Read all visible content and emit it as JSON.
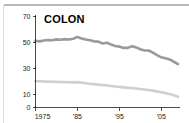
{
  "chart_data": {
    "type": "line",
    "title": "COLON",
    "xlabel": "",
    "ylabel": "",
    "xlim": [
      1975,
      2009
    ],
    "ylim": [
      0,
      70
    ],
    "grid": false,
    "legend": "none",
    "y_ticks": [
      0,
      10,
      30,
      50,
      70
    ],
    "y_tick_labels": [
      "0",
      "10",
      "30",
      "50",
      "70"
    ],
    "x_ticks": [
      1975,
      1985,
      1995,
      2005
    ],
    "x_tick_labels": [
      "1975",
      "'85",
      "'95",
      "'05"
    ],
    "series": [
      {
        "name": "incidence-dark",
        "color": "#9a9a9a",
        "stroke_width": 2.6,
        "x": [
          1975,
          1976,
          1977,
          1978,
          1979,
          1980,
          1981,
          1982,
          1983,
          1984,
          1985,
          1986,
          1987,
          1988,
          1989,
          1990,
          1991,
          1992,
          1993,
          1994,
          1995,
          1996,
          1997,
          1998,
          1999,
          2000,
          2001,
          2002,
          2003,
          2004,
          2005,
          2006,
          2007,
          2008,
          2009
        ],
        "values": [
          51.0,
          50.6,
          51.2,
          51.6,
          51.5,
          52.1,
          51.8,
          52.3,
          52.0,
          52.6,
          54.0,
          52.8,
          52.0,
          51.5,
          50.6,
          50.4,
          49.0,
          49.6,
          48.2,
          47.0,
          46.6,
          45.6,
          45.6,
          46.8,
          46.0,
          44.6,
          43.6,
          43.6,
          42.0,
          40.0,
          38.4,
          37.6,
          36.8,
          35.0,
          33.2
        ]
      },
      {
        "name": "mortality-light",
        "color": "#cfcfcf",
        "stroke_width": 2.6,
        "x": [
          1975,
          1976,
          1977,
          1978,
          1979,
          1980,
          1981,
          1982,
          1983,
          1984,
          1985,
          1986,
          1987,
          1988,
          1989,
          1990,
          1991,
          1992,
          1993,
          1994,
          1995,
          1996,
          1997,
          1998,
          1999,
          2000,
          2001,
          2002,
          2003,
          2004,
          2005,
          2006,
          2007,
          2008,
          2009
        ],
        "values": [
          20.2,
          20.1,
          19.9,
          19.8,
          19.7,
          19.6,
          19.5,
          19.4,
          19.3,
          19.2,
          19.4,
          19.0,
          18.6,
          18.2,
          17.9,
          17.5,
          17.2,
          16.9,
          16.5,
          16.1,
          15.8,
          15.4,
          15.1,
          14.8,
          14.5,
          14.1,
          13.8,
          13.4,
          12.9,
          12.3,
          11.7,
          11.0,
          10.3,
          9.4,
          8.2
        ]
      }
    ]
  }
}
